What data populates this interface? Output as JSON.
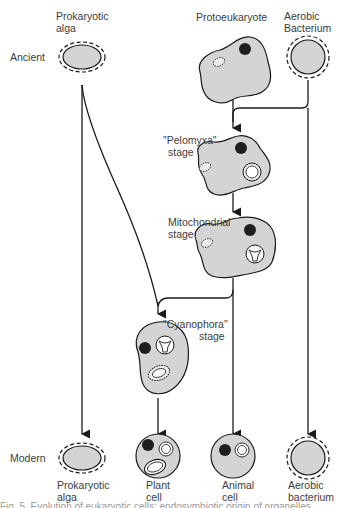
{
  "row_labels": {
    "ancient": "Ancient",
    "modern": "Modern"
  },
  "top": {
    "prokaryotic_alga": {
      "line1": "Prokaryotic",
      "line2": "alga"
    },
    "protoeukaryote": "Protoeukaryote",
    "aerobic_bacterium": {
      "line1": "Aerobic",
      "line2": "Bacterium"
    }
  },
  "stages": {
    "pelomyxa": {
      "line1": "\"Pelomyxa\"",
      "line2": "stage"
    },
    "mitochondrial": {
      "line1": "Mitochondrial",
      "line2": "stage"
    },
    "cyanophora": {
      "line1": "\"Cyanophora\"",
      "line2": "stage"
    }
  },
  "bottom": {
    "prokaryotic_alga": {
      "line1": "Prokaryotic",
      "line2": "alga"
    },
    "plant_cell": {
      "line1": "Plant",
      "line2": "cell"
    },
    "animal_cell": {
      "line1": "Animal",
      "line2": "cell"
    },
    "aerobic_bacterium": {
      "line1": "Aerobic",
      "line2": "bacterium"
    }
  },
  "caption": "Fig. 5. Evolution of eukaryotic cells: endosymbiotic origin of organelles",
  "colors": {
    "cell_fill": "#d4d4d4",
    "nucleus": "#1e1e1e",
    "line": "#1a1a1a",
    "text": "#3c3c3c"
  }
}
